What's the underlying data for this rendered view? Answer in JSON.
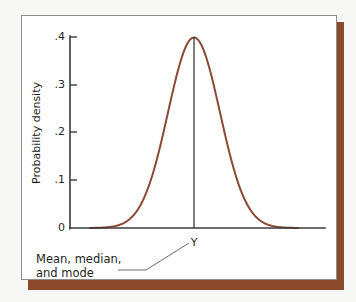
{
  "figure": {
    "background_color": "#f7f7f5",
    "card_color": "#ffffff",
    "card_border_color": "#8d8d8d",
    "shadow_color": "#8b4a2b"
  },
  "chart_data": {
    "type": "line",
    "title": "",
    "subtitle": "",
    "xlabel": "",
    "ylabel": "Probability density",
    "distribution": "normal",
    "grid": false,
    "legend": null,
    "ylim": [
      0,
      0.4
    ],
    "xlim": [
      -4,
      4
    ],
    "ytick_labels": [
      ".4",
      ".3",
      ".2",
      ".1",
      "0"
    ],
    "ytick_values": [
      0.4,
      0.3,
      0.2,
      0.1,
      0
    ],
    "xtick_labels": [],
    "xtick_values": [],
    "peak_value": 0.4,
    "mean": 0,
    "series": [
      {
        "name": "normal density",
        "color": "#8a4a33",
        "x": [
          -4,
          -3.6,
          -3.2,
          -2.8,
          -2.4,
          -2,
          -1.6,
          -1.2,
          -0.8,
          -0.4,
          0,
          0.4,
          0.8,
          1.2,
          1.6,
          2,
          2.4,
          2.8,
          3.2,
          3.6,
          4
        ],
        "values": [
          0.0001,
          0.0006,
          0.0024,
          0.0079,
          0.0224,
          0.054,
          0.1109,
          0.1942,
          0.2897,
          0.3683,
          0.3989,
          0.3683,
          0.2897,
          0.1942,
          0.1109,
          0.054,
          0.0224,
          0.0079,
          0.0024,
          0.0006,
          0.0001
        ]
      }
    ],
    "annotations": [
      {
        "name": "center-marker",
        "label": "Y",
        "at_x": 0,
        "type": "vertical-line-to-peak"
      },
      {
        "name": "mean-median-mode-callout",
        "lines": [
          "Mean, median,",
          "and mode"
        ],
        "points_to": "Y"
      }
    ]
  },
  "labels": {
    "y_axis_title": "Probability density",
    "ytick_0": ".4",
    "ytick_1": ".3",
    "ytick_2": ".2",
    "ytick_3": ".1",
    "ytick_4": "0",
    "center_marker": "Y",
    "callout_line1": "Mean, median,",
    "callout_line2": "and mode"
  }
}
